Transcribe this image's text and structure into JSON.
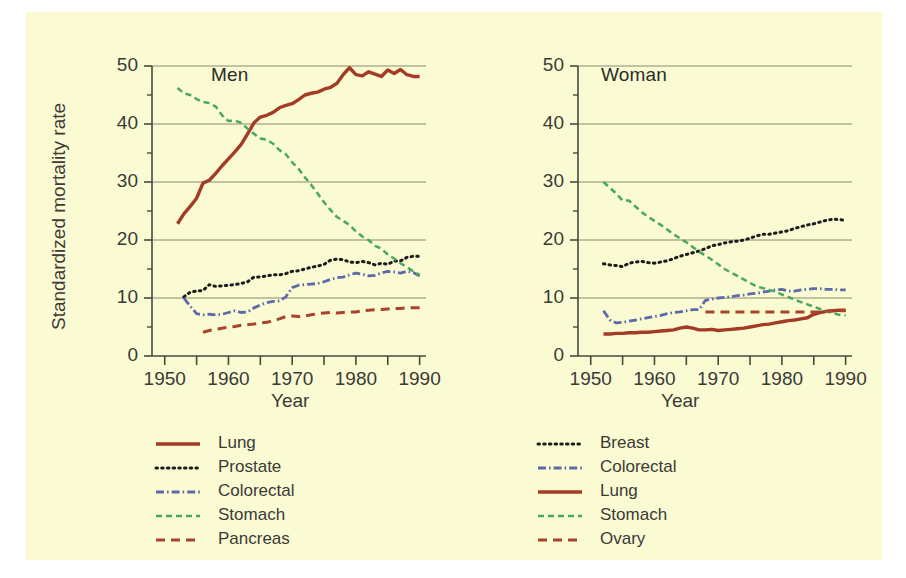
{
  "figure": {
    "background_color": "#fafbd2",
    "page_background": "#ffffff",
    "ylabel": "Standardized mortality rate",
    "xlabel_left": "Year",
    "xlabel_right": "Year"
  },
  "panels": [
    {
      "id": "men",
      "title": "Men"
    },
    {
      "id": "women",
      "title": "Woman"
    }
  ],
  "axes": {
    "y_ticks": [
      "0",
      "10",
      "20",
      "30",
      "40",
      "50"
    ],
    "y_tick_values": [
      0,
      10,
      20,
      30,
      40,
      50
    ],
    "y_minor_values": [
      5,
      15,
      25,
      35,
      45
    ],
    "ylim": [
      0,
      50
    ],
    "x_ticks": [
      "1950",
      "1960",
      "1970",
      "1980",
      "1990"
    ],
    "x_tick_values": [
      1950,
      1960,
      1970,
      1980,
      1990
    ],
    "x_minor_values": [
      1955,
      1965,
      1975,
      1985
    ],
    "xlim": [
      1948,
      1991
    ],
    "grid": "horizontal-major-only",
    "axis_color": "#4a4a3f",
    "grid_color": "#8a8a72"
  },
  "legends": {
    "left": {
      "position": "below-left-panel",
      "entries": [
        {
          "label": "Lung",
          "color": "#a33b26",
          "style": "solid"
        },
        {
          "label": "Prostate",
          "color": "#1c1c1c",
          "style": "dotted"
        },
        {
          "label": "Colorectal",
          "color": "#5c6aa8",
          "style": "dashdot"
        },
        {
          "label": "Stomach",
          "color": "#49a85e",
          "style": "dashed"
        },
        {
          "label": "Pancreas",
          "color": "#a8442c",
          "style": "dashed-long"
        }
      ]
    },
    "right": {
      "position": "below-right-panel",
      "entries": [
        {
          "label": "Breast",
          "color": "#1c1c1c",
          "style": "dotted"
        },
        {
          "label": "Colorectal",
          "color": "#5c6aa8",
          "style": "dashdot"
        },
        {
          "label": "Lung",
          "color": "#a33b26",
          "style": "solid"
        },
        {
          "label": "Stomach",
          "color": "#49a85e",
          "style": "dashed"
        },
        {
          "label": "Ovary",
          "color": "#a8442c",
          "style": "dashed-long"
        }
      ]
    }
  },
  "chart_data": {
    "type": "line",
    "title": "",
    "xlabel": "Year",
    "ylabel": "Standardized mortality rate",
    "xlim": [
      1948,
      1991
    ],
    "ylim": [
      0,
      50
    ],
    "grid": true,
    "legend_position": "bottom",
    "panels": [
      {
        "name": "Men",
        "series": [
          {
            "name": "Lung",
            "color": "#a33b26",
            "style": "solid",
            "x": [
              1952,
              1953,
              1954,
              1955,
              1956,
              1957,
              1958,
              1959,
              1960,
              1961,
              1962,
              1963,
              1964,
              1965,
              1966,
              1967,
              1968,
              1969,
              1970,
              1971,
              1972,
              1973,
              1974,
              1975,
              1976,
              1977,
              1978,
              1979,
              1980,
              1981,
              1982,
              1983,
              1984,
              1985,
              1986,
              1987,
              1988,
              1989,
              1990
            ],
            "y": [
              22.8,
              24.5,
              25.8,
              27.2,
              29.8,
              30.3,
              31.5,
              32.8,
              34.0,
              35.2,
              36.5,
              38.3,
              40.2,
              41.2,
              41.5,
              42.0,
              42.8,
              43.2,
              43.5,
              44.2,
              45.0,
              45.3,
              45.5,
              46.0,
              46.3,
              47.0,
              48.5,
              49.7,
              48.5,
              48.3,
              49.0,
              48.6,
              48.2,
              49.3,
              48.7,
              49.4,
              48.5,
              48.2,
              48.2
            ]
          },
          {
            "name": "Prostate",
            "color": "#1c1c1c",
            "style": "dotted",
            "x": [
              1953,
              1954,
              1955,
              1956,
              1957,
              1958,
              1959,
              1960,
              1961,
              1962,
              1963,
              1964,
              1965,
              1966,
              1967,
              1968,
              1969,
              1970,
              1971,
              1972,
              1973,
              1974,
              1975,
              1976,
              1977,
              1978,
              1979,
              1980,
              1981,
              1982,
              1983,
              1984,
              1985,
              1986,
              1987,
              1988,
              1989,
              1990
            ],
            "y": [
              10.2,
              11.0,
              11.2,
              11.3,
              12.3,
              12.0,
              12.1,
              12.2,
              12.3,
              12.5,
              12.8,
              13.6,
              13.6,
              13.8,
              14.0,
              14.0,
              14.2,
              14.6,
              14.7,
              15.0,
              15.3,
              15.5,
              15.8,
              16.5,
              16.7,
              16.6,
              16.2,
              16.1,
              16.3,
              16.1,
              15.7,
              16.0,
              15.8,
              16.4,
              16.4,
              17.0,
              17.2,
              17.2
            ]
          },
          {
            "name": "Colorectal",
            "color": "#5c6aa8",
            "style": "dashdot",
            "x": [
              1953,
              1954,
              1955,
              1956,
              1957,
              1958,
              1959,
              1960,
              1961,
              1962,
              1963,
              1964,
              1965,
              1966,
              1967,
              1968,
              1969,
              1970,
              1971,
              1972,
              1973,
              1974,
              1975,
              1976,
              1977,
              1978,
              1979,
              1980,
              1981,
              1982,
              1983,
              1984,
              1985,
              1986,
              1987,
              1988,
              1989,
              1990
            ],
            "y": [
              10.0,
              8.6,
              7.3,
              7.1,
              7.2,
              7.1,
              7.2,
              7.5,
              7.8,
              7.5,
              7.6,
              8.3,
              8.8,
              9.2,
              9.4,
              9.5,
              10.2,
              11.8,
              12.2,
              12.3,
              12.4,
              12.5,
              12.8,
              13.2,
              13.5,
              13.6,
              14.0,
              14.3,
              14.1,
              13.8,
              13.9,
              14.3,
              14.6,
              14.5,
              14.3,
              14.6,
              14.4,
              13.8
            ]
          },
          {
            "name": "Stomach",
            "color": "#49a85e",
            "style": "dashed",
            "x": [
              1952,
              1953,
              1954,
              1955,
              1956,
              1957,
              1958,
              1959,
              1960,
              1961,
              1962,
              1963,
              1964,
              1965,
              1966,
              1967,
              1968,
              1969,
              1970,
              1971,
              1972,
              1973,
              1974,
              1975,
              1976,
              1977,
              1978,
              1979,
              1980,
              1981,
              1982,
              1983,
              1984,
              1985,
              1986,
              1987,
              1988,
              1989,
              1990
            ],
            "y": [
              46.2,
              45.3,
              45.0,
              44.3,
              43.8,
              43.6,
              43.0,
              41.5,
              40.5,
              40.6,
              40.2,
              39.2,
              38.3,
              37.5,
              37.3,
              36.6,
              35.5,
              34.8,
              33.4,
              32.3,
              30.8,
              29.5,
              28.0,
              26.5,
              25.2,
              24.0,
              23.3,
              22.6,
              21.5,
              20.6,
              20.0,
              19.0,
              18.5,
              17.5,
              16.8,
              16.0,
              15.3,
              14.6,
              14.0
            ]
          },
          {
            "name": "Pancreas",
            "color": "#a8442c",
            "style": "dashed-long",
            "x": [
              1956,
              1957,
              1958,
              1959,
              1960,
              1961,
              1962,
              1963,
              1964,
              1965,
              1966,
              1967,
              1968,
              1969,
              1970,
              1971,
              1972,
              1973,
              1974,
              1975,
              1976,
              1977,
              1978,
              1979,
              1980,
              1981,
              1982,
              1983,
              1984,
              1985,
              1986,
              1987,
              1988,
              1989,
              1990
            ],
            "y": [
              4.1,
              4.4,
              4.6,
              4.8,
              5.0,
              5.1,
              5.3,
              5.4,
              5.5,
              5.7,
              5.8,
              6.1,
              6.4,
              6.8,
              6.9,
              6.8,
              6.9,
              7.1,
              7.3,
              7.4,
              7.5,
              7.4,
              7.5,
              7.6,
              7.6,
              7.8,
              7.9,
              8.0,
              8.0,
              8.1,
              8.2,
              8.2,
              8.3,
              8.3,
              8.3
            ]
          }
        ]
      },
      {
        "name": "Woman",
        "series": [
          {
            "name": "Breast",
            "color": "#1c1c1c",
            "style": "dotted",
            "x": [
              1952,
              1953,
              1954,
              1955,
              1956,
              1957,
              1958,
              1959,
              1960,
              1961,
              1962,
              1963,
              1964,
              1965,
              1966,
              1967,
              1968,
              1969,
              1970,
              1971,
              1972,
              1973,
              1974,
              1975,
              1976,
              1977,
              1978,
              1979,
              1980,
              1981,
              1982,
              1983,
              1984,
              1985,
              1986,
              1987,
              1988,
              1989,
              1990
            ],
            "y": [
              15.9,
              15.7,
              15.6,
              15.4,
              16.0,
              16.2,
              16.3,
              16.1,
              16.0,
              16.2,
              16.4,
              16.8,
              17.2,
              17.5,
              17.8,
              18.1,
              18.5,
              19.0,
              19.2,
              19.5,
              19.7,
              19.8,
              20.0,
              20.3,
              20.7,
              21.0,
              21.0,
              21.2,
              21.4,
              21.6,
              22.0,
              22.3,
              22.6,
              22.8,
              23.1,
              23.4,
              23.6,
              23.5,
              23.4
            ]
          },
          {
            "name": "Colorectal",
            "color": "#5c6aa8",
            "style": "dashdot",
            "x": [
              1952,
              1953,
              1954,
              1955,
              1956,
              1957,
              1958,
              1959,
              1960,
              1961,
              1962,
              1963,
              1964,
              1965,
              1966,
              1967,
              1968,
              1969,
              1970,
              1971,
              1972,
              1973,
              1974,
              1975,
              1976,
              1977,
              1978,
              1979,
              1980,
              1981,
              1982,
              1983,
              1984,
              1985,
              1986,
              1987,
              1988,
              1989,
              1990
            ],
            "y": [
              7.8,
              6.2,
              5.7,
              5.8,
              6.0,
              6.2,
              6.4,
              6.6,
              6.8,
              7.0,
              7.3,
              7.5,
              7.6,
              7.8,
              8.0,
              8.0,
              9.6,
              9.8,
              10.0,
              10.1,
              10.2,
              10.4,
              10.5,
              10.7,
              10.8,
              11.0,
              11.2,
              11.4,
              11.5,
              11.2,
              11.2,
              11.4,
              11.5,
              11.6,
              11.6,
              11.5,
              11.5,
              11.4,
              11.4
            ]
          },
          {
            "name": "Lung",
            "color": "#a33b26",
            "style": "solid",
            "x": [
              1952,
              1953,
              1954,
              1955,
              1956,
              1957,
              1958,
              1959,
              1960,
              1961,
              1962,
              1963,
              1964,
              1965,
              1966,
              1967,
              1968,
              1969,
              1970,
              1971,
              1972,
              1973,
              1974,
              1975,
              1976,
              1977,
              1978,
              1979,
              1980,
              1981,
              1982,
              1983,
              1984,
              1985,
              1986,
              1987,
              1988,
              1989,
              1990
            ],
            "y": [
              3.8,
              3.8,
              3.9,
              3.9,
              4.0,
              4.0,
              4.1,
              4.1,
              4.2,
              4.3,
              4.4,
              4.5,
              4.8,
              5.0,
              4.8,
              4.5,
              4.5,
              4.6,
              4.4,
              4.5,
              4.6,
              4.7,
              4.8,
              5.0,
              5.2,
              5.4,
              5.5,
              5.7,
              5.9,
              6.1,
              6.2,
              6.4,
              6.6,
              7.2,
              7.5,
              7.7,
              7.8,
              7.9,
              7.9
            ]
          },
          {
            "name": "Stomach",
            "color": "#49a85e",
            "style": "dashed",
            "x": [
              1952,
              1953,
              1954,
              1955,
              1956,
              1957,
              1958,
              1959,
              1960,
              1961,
              1962,
              1963,
              1964,
              1965,
              1966,
              1967,
              1968,
              1969,
              1970,
              1971,
              1972,
              1973,
              1974,
              1975,
              1976,
              1977,
              1978,
              1979,
              1980,
              1981,
              1982,
              1983,
              1984,
              1985,
              1986,
              1987,
              1988,
              1989,
              1990
            ],
            "y": [
              30.0,
              29.0,
              28.0,
              26.8,
              26.8,
              25.8,
              24.8,
              24.0,
              23.3,
              22.6,
              21.8,
              21.0,
              20.3,
              19.6,
              18.8,
              18.0,
              17.3,
              16.6,
              15.8,
              15.0,
              14.4,
              13.8,
              13.2,
              12.6,
              12.0,
              11.7,
              11.4,
              11.1,
              10.6,
              10.2,
              9.7,
              9.3,
              8.9,
              8.5,
              8.1,
              7.7,
              7.4,
              7.1,
              7.0
            ]
          },
          {
            "name": "Ovary",
            "color": "#a8442c",
            "style": "dashed-long",
            "x": [
              1968,
              1969,
              1970,
              1971,
              1972,
              1973,
              1974,
              1975,
              1976,
              1977,
              1978,
              1979,
              1980,
              1981,
              1982,
              1983,
              1984,
              1985,
              1986,
              1987,
              1988,
              1989,
              1990
            ],
            "y": [
              7.6,
              7.6,
              7.6,
              7.6,
              7.6,
              7.6,
              7.6,
              7.6,
              7.6,
              7.6,
              7.6,
              7.6,
              7.6,
              7.6,
              7.6,
              7.6,
              7.6,
              7.6,
              7.6,
              7.7,
              7.8,
              7.8,
              7.8
            ]
          }
        ]
      }
    ]
  }
}
